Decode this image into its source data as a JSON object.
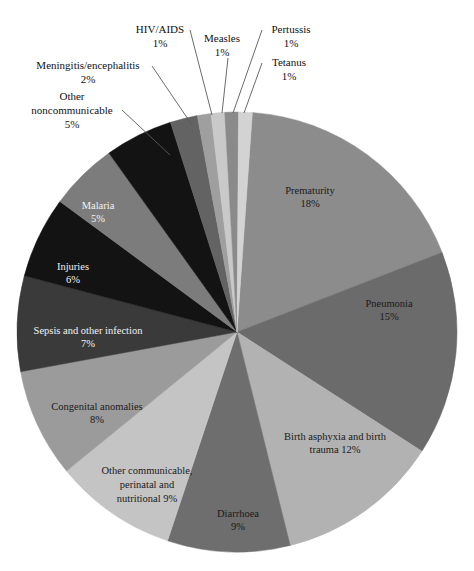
{
  "chart_data": {
    "type": "pie",
    "title": "",
    "subtitle": "",
    "xlabel": "",
    "ylabel": "",
    "legend_position": "none",
    "grid": false,
    "units": "percent",
    "total": 100,
    "center": {
      "x": 237,
      "y": 332
    },
    "radius": 220,
    "start_angle_deg": -86,
    "direction": "clockwise",
    "categories": [
      "Prematurity",
      "Pneumonia",
      "Birth asphyxia and birth trauma",
      "Diarrhoea",
      "Other communicable, perinatal and nutritional",
      "Congenital anomalies",
      "Sepsis and other infection",
      "Injuries",
      "Malaria",
      "Other noncommunicable",
      "Meningitis/encephalitis",
      "HIV/AIDS",
      "Measles",
      "Pertussis",
      "Tetanus"
    ],
    "values": [
      18,
      15,
      12,
      9,
      9,
      8,
      7,
      6,
      5,
      5,
      2,
      1,
      1,
      1,
      1
    ],
    "colors": [
      "#8c8c8c",
      "#6b6b6b",
      "#b2b2b2",
      "#6e6e6e",
      "#c4c4c4",
      "#9b9b9b",
      "#3a3a3a",
      "#131313",
      "#7c7c7c",
      "#131313",
      "#636363",
      "#9f9f9f",
      "#c9c9c9",
      "#8a8a8a",
      "#d3d3d3"
    ],
    "slices": [
      {
        "name": "Prematurity",
        "value": 18,
        "label": "Prematurity",
        "percent_label": "18%",
        "color": "#8c8c8c",
        "label_style": "inside-dark-text",
        "label_x": 310,
        "label_y": 192
      },
      {
        "name": "Pneumonia",
        "value": 15,
        "label": "Pneumonia",
        "percent_label": "15%",
        "color": "#6b6b6b",
        "label_style": "inside-dark-text",
        "label_x": 389,
        "label_y": 305
      },
      {
        "name": "Birth asphyxia and birth trauma",
        "value": 12,
        "label": "Birth asphyxia and birth",
        "percent_label": "trauma 12%",
        "color": "#b2b2b2",
        "label_style": "inside-dark-text",
        "label_x": 335,
        "label_y": 438
      },
      {
        "name": "Diarrhoea",
        "value": 9,
        "label": "Diarrhoea",
        "percent_label": "9%",
        "color": "#6e6e6e",
        "label_style": "inside-dark-text",
        "label_x": 238,
        "label_y": 515
      },
      {
        "name": "Other communicable, perinatal and nutritional",
        "value": 9,
        "label": "Other communicable,",
        "percent_label": "9%",
        "color": "#c4c4c4",
        "label_style": "inside-dark-text",
        "label_x": 147,
        "label_y": 472
      },
      {
        "name": "Congenital anomalies",
        "value": 8,
        "label": "Congenital anomalies",
        "percent_label": "8%",
        "color": "#9b9b9b",
        "label_style": "inside-dark-text",
        "label_x": 97,
        "label_y": 408
      },
      {
        "name": "Sepsis and other infection",
        "value": 7,
        "label": "Sepsis and other infection",
        "percent_label": "7%",
        "color": "#3a3a3a",
        "label_style": "inside-light-text",
        "label_x": 88,
        "label_y": 332
      },
      {
        "name": "Injuries",
        "value": 6,
        "label": "Injuries",
        "percent_label": "6%",
        "color": "#131313",
        "label_style": "inside-light-text",
        "label_x": 73,
        "label_y": 268
      },
      {
        "name": "Malaria",
        "value": 5,
        "label": "Malaria",
        "percent_label": "5%",
        "color": "#7c7c7c",
        "label_style": "inside-light-text",
        "label_x": 98,
        "label_y": 207
      },
      {
        "name": "Other noncommunicable",
        "value": 5,
        "label": "Other",
        "percent_label": "5%",
        "color": "#131313",
        "label_style": "callout",
        "callout": {
          "line1": "Other",
          "line2": "noncommunicable",
          "line3": "5%",
          "text_x": 72,
          "text_y": 100,
          "from_x": 122,
          "from_y": 110,
          "to_x": 170,
          "to_y": 155
        }
      },
      {
        "name": "Meningitis/encephalitis",
        "value": 2,
        "label": "Meningitis/encephalitis",
        "percent_label": "2%",
        "color": "#636363",
        "label_style": "callout",
        "callout": {
          "line1": "Meningitis/encephalitis",
          "line2": "2%",
          "line3": "",
          "text_x": 88,
          "text_y": 69,
          "from_x": 152,
          "from_y": 66,
          "to_x": 192,
          "to_y": 125
        }
      },
      {
        "name": "HIV/AIDS",
        "value": 1,
        "label": "HIV/AIDS",
        "percent_label": "1%",
        "color": "#9f9f9f",
        "label_style": "callout",
        "callout": {
          "line1": "HIV/AIDS",
          "line2": "1%",
          "line3": "",
          "text_x": 160,
          "text_y": 33,
          "from_x": 190,
          "from_y": 30,
          "to_x": 212,
          "to_y": 115
        }
      },
      {
        "name": "Measles",
        "value": 1,
        "label": "Measles",
        "percent_label": "1%",
        "color": "#c9c9c9",
        "label_style": "callout",
        "callout": {
          "line1": "Measles",
          "line2": "1%",
          "line3": "",
          "text_x": 222,
          "text_y": 42,
          "from_x": 228,
          "from_y": 58,
          "to_x": 222,
          "to_y": 113
        }
      },
      {
        "name": "Pertussis",
        "value": 1,
        "label": "Pertussis",
        "percent_label": "1%",
        "color": "#8a8a8a",
        "label_style": "callout",
        "callout": {
          "line1": "Pertussis",
          "line2": "1%",
          "line3": "",
          "text_x": 291,
          "text_y": 33,
          "from_x": 262,
          "from_y": 30,
          "to_x": 233,
          "to_y": 113
        }
      },
      {
        "name": "Tetanus",
        "value": 1,
        "label": "Tetanus",
        "percent_label": "1%",
        "color": "#d3d3d3",
        "label_style": "callout",
        "callout": {
          "line1": "Tetanus",
          "line2": "1%",
          "line3": "",
          "text_x": 289,
          "text_y": 66,
          "from_x": 262,
          "from_y": 63,
          "to_x": 244,
          "to_y": 113
        }
      }
    ]
  },
  "figure": {
    "background_color": "#ffffff",
    "outline_color": "#5a5a5a"
  }
}
